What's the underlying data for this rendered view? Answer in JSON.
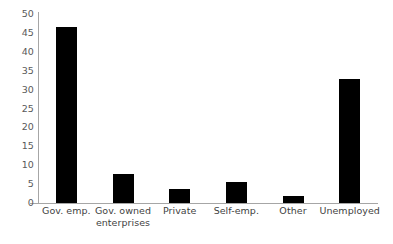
{
  "chart_data": {
    "type": "bar",
    "title": "",
    "subtitle": "",
    "xlabel": "",
    "ylabel": "",
    "categories": [
      "Gov. emp.",
      "Gov. owned enterprises",
      "Private",
      "Self-emp.",
      "Other",
      "Unemployed"
    ],
    "values": [
      46.6,
      7.7,
      3.7,
      5.6,
      1.8,
      32.8
    ],
    "ylim": [
      0,
      50
    ],
    "ytick_labels": [
      "50",
      "45",
      "40",
      "35",
      "30",
      "25",
      "20",
      "15",
      "10",
      "5",
      "0"
    ],
    "ytick_values": [
      50,
      45,
      40,
      35,
      30,
      25,
      20,
      15,
      10,
      5,
      0
    ],
    "grid": false,
    "legend": false,
    "legend_position": "none",
    "bar_color": "#000000",
    "axis_color": "#a6a6a6",
    "tick_label_color": "#595959",
    "category_label_color": "#3f3f3f",
    "background_color": "#ffffff",
    "annotations": []
  },
  "category_label_lines": [
    [
      "Gov. emp."
    ],
    [
      "Gov. owned",
      "enterprises"
    ],
    [
      "Private"
    ],
    [
      "Self-emp."
    ],
    [
      "Other"
    ],
    [
      "Unemployed"
    ]
  ]
}
